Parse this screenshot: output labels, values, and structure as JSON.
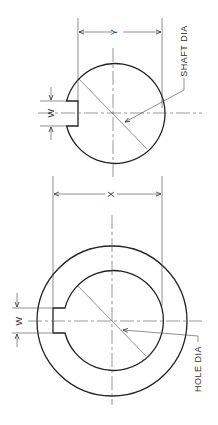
{
  "drawing": {
    "shaft_view": {
      "dimension_y_label": "Y",
      "keyway_width_label": "W",
      "leader_label": "SHAFT DIA"
    },
    "hub_view": {
      "dimension_x_label": "X",
      "keyway_width_label": "W",
      "leader_label": "HOLE DIA"
    },
    "colors": {
      "line": "#222222",
      "background": "#ffffff"
    }
  }
}
